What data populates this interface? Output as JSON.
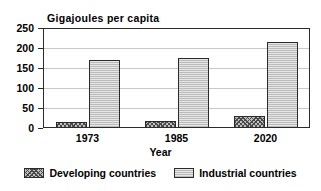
{
  "chart_data": {
    "type": "bar",
    "title": "Gigajoules per capita",
    "xlabel": "Year",
    "ylabel": "",
    "categories": [
      "1973",
      "1985",
      "2020"
    ],
    "ylim": [
      0,
      250
    ],
    "yticks": [
      0,
      50,
      100,
      150,
      200,
      250
    ],
    "grid": true,
    "legend_position": "bottom",
    "series": [
      {
        "name": "Developing countries",
        "values": [
          15,
          18,
          30
        ],
        "fill": "#bfbfbf",
        "pattern": "cross-hatch"
      },
      {
        "name": "Industrial countries",
        "values": [
          171,
          176,
          215
        ],
        "fill": "#e6e6e6",
        "pattern": "light-stipple"
      }
    ]
  },
  "axis": {
    "tick_labels": [
      "250",
      "200",
      "150",
      "100",
      "50",
      "0"
    ]
  },
  "legend": {
    "items": [
      {
        "label": "Developing countries"
      },
      {
        "label": "Industrial countries"
      }
    ]
  }
}
